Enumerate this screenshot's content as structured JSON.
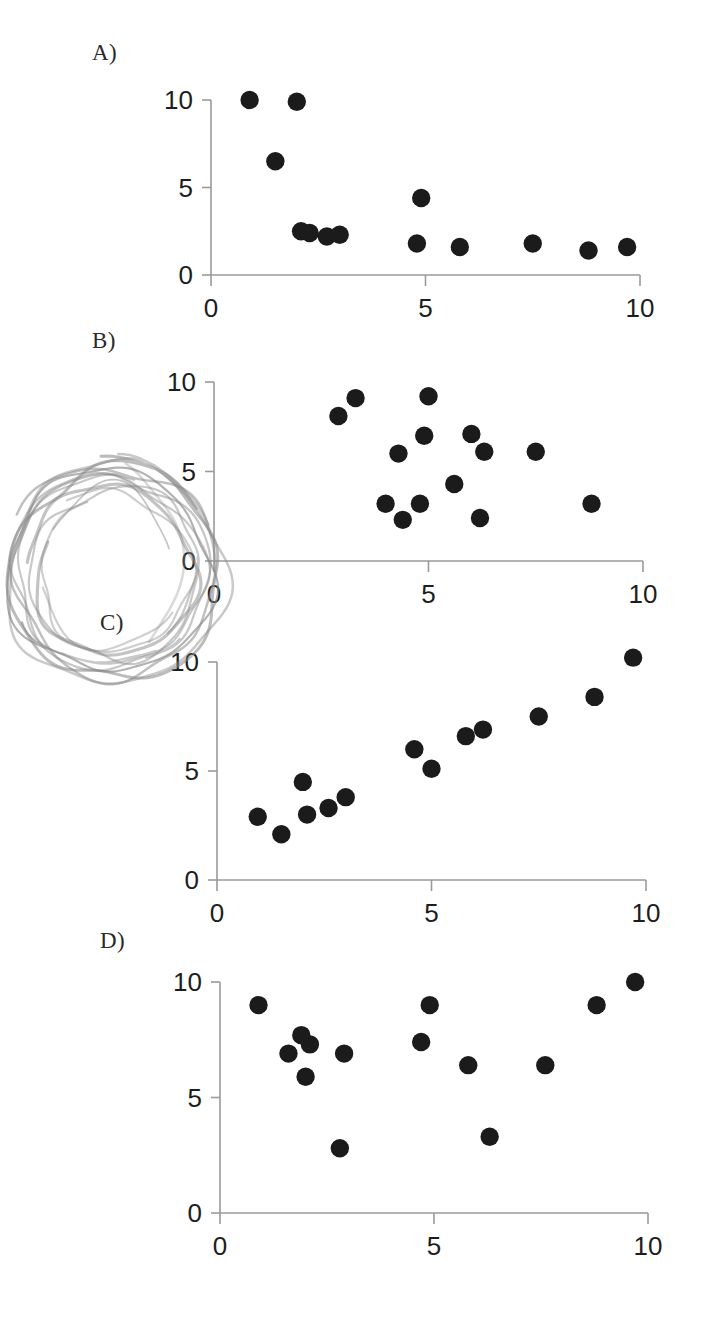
{
  "figure": {
    "panels": [
      {
        "label": "A)",
        "label_x": 92,
        "label_y": 40,
        "origin_x": 211,
        "origin_y": 275,
        "x_unit_px": 42.9,
        "y_unit_px": 17.5,
        "x_ticks": [
          "0",
          "5",
          "10"
        ],
        "y_ticks": [
          "0",
          "5",
          "10"
        ]
      },
      {
        "label": "B)",
        "label_x": 92,
        "label_y": 328,
        "origin_x": 214,
        "origin_y": 561,
        "x_unit_px": 42.9,
        "y_unit_px": 17.9,
        "x_ticks": [
          "0",
          "5",
          "10"
        ],
        "y_ticks": [
          "0",
          "5",
          "10"
        ]
      },
      {
        "label": "C)",
        "label_x": 100,
        "label_y": 610,
        "origin_x": 217,
        "origin_y": 880,
        "x_unit_px": 42.9,
        "y_unit_px": 21.8,
        "x_ticks": [
          "0",
          "5",
          "10"
        ],
        "y_ticks": [
          "0",
          "5",
          "10"
        ]
      },
      {
        "label": "D)",
        "label_x": 100,
        "label_y": 928,
        "origin_x": 220,
        "origin_y": 1213,
        "x_unit_px": 42.8,
        "y_unit_px": 23.1,
        "x_ticks": [
          "0",
          "5",
          "10"
        ],
        "y_ticks": [
          "0",
          "5",
          "10"
        ]
      }
    ],
    "annotation": {
      "type": "hand-drawn-pencil-circle",
      "center_x": 112,
      "center_y": 572,
      "radius_x": 112,
      "radius_y": 110,
      "color": "#8a8a8a",
      "passes": 9
    }
  },
  "chart_data": [
    {
      "type": "scatter",
      "title": "A)",
      "xlabel": "",
      "ylabel": "",
      "xlim": [
        0,
        10
      ],
      "ylim": [
        0,
        10
      ],
      "xticks": [
        0,
        5,
        10
      ],
      "yticks": [
        0,
        5,
        10
      ],
      "grid": false,
      "legend": "none",
      "marker": "filled-circle",
      "marker_color": "#1b1b1b",
      "description": "Strong negative non-linear (decaying) relationship",
      "points": [
        [
          0.9,
          10.0
        ],
        [
          1.5,
          6.5
        ],
        [
          2.0,
          9.9
        ],
        [
          2.1,
          2.5
        ],
        [
          2.3,
          2.4
        ],
        [
          2.7,
          2.2
        ],
        [
          3.0,
          2.3
        ],
        [
          4.9,
          4.4
        ],
        [
          4.8,
          1.8
        ],
        [
          5.8,
          1.6
        ],
        [
          7.5,
          1.8
        ],
        [
          8.8,
          1.4
        ],
        [
          9.7,
          1.6
        ]
      ]
    },
    {
      "type": "scatter",
      "title": "B)",
      "xlabel": "",
      "ylabel": "",
      "xlim": [
        0,
        10
      ],
      "ylim": [
        0,
        10
      ],
      "xticks": [
        0,
        5,
        10
      ],
      "yticks": [
        0,
        5,
        10
      ],
      "grid": false,
      "legend": "none",
      "marker": "filled-circle",
      "marker_color": "#1b1b1b",
      "description": "No apparent relationship; random scatter cloud",
      "points": [
        [
          2.9,
          8.1
        ],
        [
          3.3,
          9.1
        ],
        [
          4.3,
          6.0
        ],
        [
          4.9,
          7.0
        ],
        [
          5.0,
          9.2
        ],
        [
          6.0,
          7.1
        ],
        [
          6.3,
          6.1
        ],
        [
          7.5,
          6.1
        ],
        [
          5.6,
          4.3
        ],
        [
          4.0,
          3.2
        ],
        [
          4.8,
          3.2
        ],
        [
          6.2,
          2.4
        ],
        [
          4.4,
          2.3
        ],
        [
          8.8,
          3.2
        ]
      ]
    },
    {
      "type": "scatter",
      "title": "C)",
      "xlabel": "",
      "ylabel": "",
      "xlim": [
        0,
        10
      ],
      "ylim": [
        0,
        10
      ],
      "xticks": [
        0,
        5,
        10
      ],
      "yticks": [
        0,
        5,
        10
      ],
      "grid": false,
      "legend": "none",
      "marker": "filled-circle",
      "marker_color": "#1b1b1b",
      "description": "Strong positive linear relationship",
      "points": [
        [
          0.95,
          2.9
        ],
        [
          1.5,
          2.1
        ],
        [
          2.0,
          4.5
        ],
        [
          2.1,
          3.0
        ],
        [
          2.6,
          3.3
        ],
        [
          3.0,
          3.8
        ],
        [
          4.6,
          6.0
        ],
        [
          5.0,
          5.1
        ],
        [
          5.8,
          6.6
        ],
        [
          6.2,
          6.9
        ],
        [
          7.5,
          7.5
        ],
        [
          8.8,
          8.4
        ],
        [
          9.7,
          10.2
        ]
      ]
    },
    {
      "type": "scatter",
      "title": "D)",
      "xlabel": "",
      "ylabel": "",
      "xlim": [
        0,
        10
      ],
      "ylim": [
        0,
        10
      ],
      "xticks": [
        0,
        5,
        10
      ],
      "yticks": [
        0,
        5,
        10
      ],
      "grid": false,
      "legend": "none",
      "marker": "filled-circle",
      "marker_color": "#1b1b1b",
      "description": "Weak or U-shaped relationship with outliers",
      "points": [
        [
          0.9,
          9.0
        ],
        [
          1.6,
          6.9
        ],
        [
          1.9,
          7.7
        ],
        [
          2.1,
          7.3
        ],
        [
          2.0,
          5.9
        ],
        [
          2.9,
          6.9
        ],
        [
          2.8,
          2.8
        ],
        [
          4.7,
          7.4
        ],
        [
          4.9,
          9.0
        ],
        [
          5.8,
          6.4
        ],
        [
          6.3,
          3.3
        ],
        [
          7.6,
          6.4
        ],
        [
          8.8,
          9.0
        ],
        [
          9.7,
          10.0
        ]
      ]
    }
  ]
}
